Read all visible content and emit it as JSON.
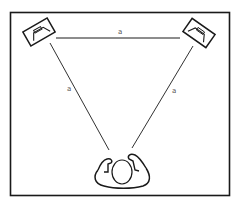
{
  "diagram": {
    "labels": {
      "top_side": "a",
      "left_side": "a",
      "right_side": "a"
    },
    "nodes": [
      {
        "id": "left-speaker",
        "kind": "speaker"
      },
      {
        "id": "right-speaker",
        "kind": "speaker"
      },
      {
        "id": "listener",
        "kind": "person-top-view"
      }
    ],
    "colors": {
      "stroke": "#1a1a1a",
      "label": "#555555",
      "background": "#ffffff"
    }
  }
}
